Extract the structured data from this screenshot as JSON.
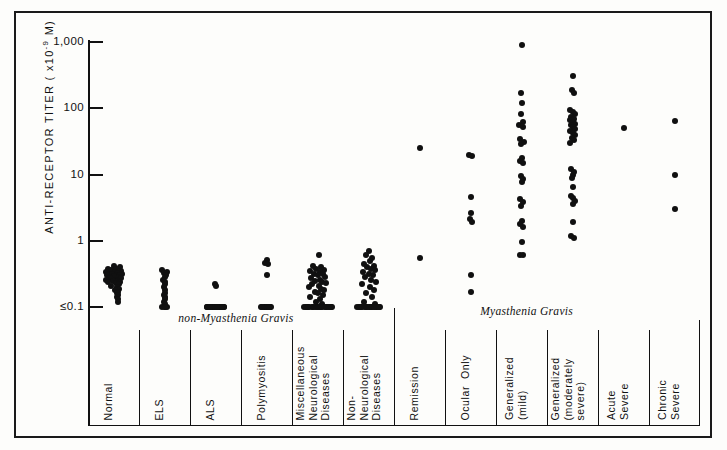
{
  "figure": {
    "yaxis": {
      "title": "ANTI-RECEPTOR TITER ( x10",
      "title_exponent": "-9",
      "title_unit": " M)",
      "tick_labels": [
        "1,000",
        "100",
        "10",
        "1",
        "≤0.1"
      ],
      "tick_values": [
        1000,
        100,
        10,
        1,
        0.1
      ],
      "scale": "log"
    },
    "group_headers": [
      {
        "label": "non-Myasthenia Gravis"
      },
      {
        "label": "Myasthenia Gravis"
      }
    ],
    "categories": [
      {
        "label": "Normal"
      },
      {
        "label": "ELS"
      },
      {
        "label": "ALS"
      },
      {
        "label": "Polymyositis"
      },
      {
        "label": "Miscellaneous\nNeurological\nDiseases"
      },
      {
        "label": "Non-\nNeurological\nDiseases"
      },
      {
        "label": "Remission"
      },
      {
        "label": "Ocular  Only"
      },
      {
        "label": "Generalized\n(mild)"
      },
      {
        "label": "Generalized\n(moderately\nsevere)"
      },
      {
        "label": "Acute\nSevere"
      },
      {
        "label": "Chronic\nSevere"
      }
    ]
  },
  "chart_data": {
    "type": "scatter",
    "title": "",
    "xlabel": "",
    "ylabel": "ANTI-RECEPTOR TITER ( x10^-9 M)",
    "yscale": "log",
    "ylim": [
      0.1,
      1000
    ],
    "ytick_labels": [
      "1,000",
      "100",
      "10",
      "1",
      "≤0.1"
    ],
    "ytick_values": [
      1000,
      100,
      10,
      1,
      0.1
    ],
    "grid": false,
    "legend": "none",
    "groups": [
      {
        "name": "non-Myasthenia Gravis",
        "categories": [
          "Normal",
          "ELS",
          "ALS",
          "Polymyositis",
          "Miscellaneous Neurological Diseases",
          "Non-Neurological Diseases"
        ]
      },
      {
        "name": "Myasthenia Gravis",
        "categories": [
          "Remission",
          "Ocular Only",
          "Generalized (mild)",
          "Generalized (moderately severe)",
          "Acute Severe",
          "Chronic Severe"
        ]
      }
    ],
    "series": [
      {
        "name": "Normal",
        "values": [
          0.42,
          0.4,
          0.38,
          0.38,
          0.36,
          0.35,
          0.34,
          0.34,
          0.33,
          0.32,
          0.32,
          0.31,
          0.3,
          0.3,
          0.3,
          0.29,
          0.28,
          0.28,
          0.27,
          0.27,
          0.26,
          0.26,
          0.25,
          0.25,
          0.24,
          0.24,
          0.23,
          0.22,
          0.21,
          0.2,
          0.19,
          0.18,
          0.17,
          0.16,
          0.15,
          0.14,
          0.13,
          0.12
        ],
        "jitter": [
          0.0,
          0.3,
          -0.28,
          0.14,
          -0.12,
          0.34,
          -0.34,
          0.08,
          0.22,
          -0.2,
          0.38,
          -0.06,
          0.16,
          -0.32,
          0.3,
          0.02,
          -0.22,
          0.26,
          0.36,
          -0.16,
          0.1,
          -0.36,
          0.2,
          -0.02,
          0.32,
          -0.26,
          0.12,
          0.24,
          -0.1,
          0.18,
          0.28,
          0.06,
          0.22,
          0.16,
          0.2,
          0.18,
          0.22,
          0.2
        ]
      },
      {
        "name": "ELS",
        "values": [
          0.36,
          0.34,
          0.33,
          0.3,
          0.28,
          0.26,
          0.24,
          0.22,
          0.2,
          0.18,
          0.16,
          0.15,
          0.14,
          0.13,
          0.12,
          0.11,
          0.1,
          0.1,
          0.1,
          0.1
        ],
        "jitter": [
          -0.1,
          0.12,
          -0.04,
          0.06,
          0.0,
          -0.06,
          0.04,
          0.0,
          -0.04,
          0.04,
          0.0,
          -0.04,
          0.04,
          0.0,
          -0.04,
          0.04,
          -0.1,
          0.0,
          0.1,
          0.04
        ]
      },
      {
        "name": "ALS",
        "values": [
          0.22,
          0.21,
          0.1,
          0.1,
          0.1,
          0.1,
          0.1,
          0.1,
          0.1,
          0.1,
          0.1,
          0.1,
          0.1,
          0.1,
          0.1,
          0.1,
          0.1,
          0.1,
          0.1,
          0.1,
          0.1,
          0.1,
          0.1,
          0.1,
          0.1
        ],
        "jitter": [
          -0.02,
          0.03,
          -0.4,
          -0.3,
          -0.2,
          -0.1,
          0.0,
          0.1,
          0.2,
          0.3,
          0.4,
          -0.38,
          -0.24,
          -0.12,
          0.02,
          0.14,
          0.26,
          0.38,
          -0.34,
          -0.18,
          -0.02,
          0.14,
          0.3,
          0.08,
          -0.26
        ]
      },
      {
        "name": "Polymyositis",
        "values": [
          0.52,
          0.46,
          0.44,
          0.3,
          0.1,
          0.1,
          0.1,
          0.1,
          0.1,
          0.1,
          0.1,
          0.1,
          0.1,
          0.1,
          0.1
        ],
        "jitter": [
          0.0,
          -0.08,
          0.08,
          0.0,
          -0.26,
          -0.14,
          -0.02,
          0.1,
          0.22,
          -0.2,
          -0.08,
          0.04,
          0.16,
          0.0,
          0.1
        ]
      },
      {
        "name": "Miscellaneous Neurological Diseases",
        "values": [
          0.6,
          0.42,
          0.4,
          0.38,
          0.36,
          0.35,
          0.34,
          0.32,
          0.31,
          0.3,
          0.28,
          0.27,
          0.26,
          0.25,
          0.24,
          0.23,
          0.22,
          0.21,
          0.2,
          0.19,
          0.18,
          0.17,
          0.16,
          0.15,
          0.14,
          0.13,
          0.12,
          0.11,
          0.1,
          0.1,
          0.1,
          0.1,
          0.1,
          0.1,
          0.1,
          0.1,
          0.1,
          0.1,
          0.1,
          0.1,
          0.1,
          0.1,
          0.1,
          0.1,
          0.1,
          0.1,
          0.1,
          0.1
        ],
        "jitter": [
          0.05,
          -0.22,
          0.18,
          -0.06,
          0.3,
          -0.34,
          0.1,
          0.26,
          -0.18,
          0.02,
          0.34,
          -0.3,
          0.14,
          -0.1,
          0.22,
          0.38,
          -0.26,
          0.06,
          -0.38,
          0.18,
          0.3,
          -0.14,
          0.02,
          0.26,
          -0.34,
          0.1,
          -0.06,
          0.22,
          -0.62,
          -0.5,
          -0.38,
          -0.26,
          -0.14,
          -0.02,
          0.1,
          0.22,
          0.34,
          0.46,
          0.58,
          0.66,
          -0.56,
          -0.44,
          -0.2,
          0.04,
          0.16,
          0.4,
          0.52,
          0.64
        ]
      },
      {
        "name": "Non-Neurological Diseases",
        "values": [
          0.7,
          0.62,
          0.55,
          0.5,
          0.45,
          0.42,
          0.4,
          0.38,
          0.36,
          0.34,
          0.32,
          0.3,
          0.28,
          0.26,
          0.24,
          0.22,
          0.2,
          0.18,
          0.16,
          0.14,
          0.12,
          0.11,
          0.1,
          0.1,
          0.1,
          0.1,
          0.1,
          0.1,
          0.1,
          0.1,
          0.1,
          0.1,
          0.1,
          0.1,
          0.1,
          0.1,
          0.1,
          0.1,
          0.1,
          0.1
        ],
        "jitter": [
          0.02,
          -0.14,
          0.18,
          0.06,
          -0.22,
          0.26,
          -0.06,
          0.14,
          0.3,
          -0.26,
          0.02,
          0.22,
          -0.18,
          0.1,
          0.34,
          -0.3,
          0.06,
          0.26,
          -0.1,
          0.18,
          -0.22,
          0.3,
          -0.54,
          -0.42,
          -0.3,
          -0.18,
          -0.06,
          0.06,
          0.18,
          0.3,
          0.42,
          0.54,
          -0.46,
          -0.34,
          -0.1,
          0.14,
          0.38,
          0.5,
          0.02,
          0.26
        ]
      },
      {
        "name": "Remission",
        "values": [
          25.0,
          0.55
        ],
        "jitter": [
          0.0,
          0.0
        ]
      },
      {
        "name": "Ocular Only",
        "values": [
          20.0,
          19.0,
          4.5,
          2.6,
          2.1,
          1.9,
          0.3,
          0.17
        ],
        "jitter": [
          -0.05,
          0.06,
          0.0,
          0.0,
          -0.04,
          0.05,
          0.0,
          0.0
        ]
      },
      {
        "name": "Generalized (mild)",
        "values": [
          900.0,
          170.0,
          120.0,
          82.0,
          62.0,
          55.0,
          52.0,
          34.0,
          31.0,
          29.0,
          18.0,
          16.0,
          15.0,
          9.5,
          8.5,
          7.8,
          4.2,
          3.8,
          3.4,
          2.0,
          1.8,
          1.6,
          0.95,
          0.62,
          0.6
        ],
        "jitter": [
          0.0,
          -0.04,
          0.02,
          -0.02,
          0.06,
          -0.1,
          0.08,
          -0.06,
          0.1,
          -0.02,
          0.04,
          -0.08,
          0.08,
          -0.04,
          0.06,
          0.02,
          -0.08,
          0.06,
          -0.02,
          0.04,
          -0.06,
          0.06,
          0.0,
          -0.06,
          0.06
        ]
      },
      {
        "name": "Generalized (moderately severe)",
        "values": [
          310.0,
          190.0,
          170.0,
          95.0,
          88.0,
          82.0,
          75.0,
          70.0,
          66.0,
          62.0,
          58.0,
          55.0,
          52.0,
          48.0,
          45.0,
          42.0,
          39.0,
          36.0,
          33.0,
          30.0,
          12.0,
          11.0,
          10.0,
          9.0,
          6.5,
          4.8,
          4.4,
          4.0,
          3.6,
          1.9,
          1.2,
          1.1
        ],
        "jitter": [
          0.0,
          -0.04,
          0.06,
          -0.1,
          0.04,
          0.12,
          -0.06,
          0.08,
          -0.12,
          0.0,
          0.1,
          -0.08,
          0.04,
          0.14,
          -0.1,
          0.02,
          0.12,
          -0.04,
          0.08,
          -0.12,
          -0.06,
          0.06,
          0.0,
          -0.02,
          0.0,
          -0.08,
          0.02,
          0.1,
          0.04,
          0.0,
          -0.05,
          0.05
        ]
      },
      {
        "name": "Acute Severe",
        "values": [
          50.0
        ],
        "jitter": [
          0.0
        ]
      },
      {
        "name": "Chronic Severe",
        "values": [
          65.0,
          10.0,
          3.0
        ],
        "jitter": [
          0.0,
          0.0,
          0.0
        ]
      }
    ]
  }
}
